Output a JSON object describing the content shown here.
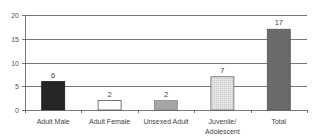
{
  "chart_data": {
    "type": "bar",
    "title": "",
    "xlabel": "",
    "ylabel": "",
    "categories": [
      "Adult Male",
      "Adult Female",
      "Unsexed Adult",
      "Juvenile/ Adolescent",
      "Total"
    ],
    "category_lines": [
      [
        "Adult Male"
      ],
      [
        "Adult Female"
      ],
      [
        "Unsexed Adult"
      ],
      [
        "Juvenile/",
        "Adolescent"
      ],
      [
        "Total"
      ]
    ],
    "values": [
      6,
      2,
      2,
      7,
      17
    ],
    "data_labels": [
      "6",
      "2",
      "2",
      "7",
      "17"
    ],
    "ylim": [
      0,
      20
    ],
    "yticks": [
      0,
      5,
      10,
      15,
      20
    ],
    "ytick_labels": [
      "0",
      "5",
      "10",
      "15",
      "20"
    ],
    "grid": true,
    "legend": null,
    "bar_styles": [
      {
        "fill": "#262626",
        "stroke": "#1a1a1a",
        "pattern": "solid-black"
      },
      {
        "fill": "#ffffff",
        "stroke": "#555555",
        "pattern": "white"
      },
      {
        "fill": "#a6a6a6",
        "stroke": "#8a8a8a",
        "pattern": "solid-gray"
      },
      {
        "fill": "#dcdcdc",
        "stroke": "#666666",
        "pattern": "dotted-light-gray"
      },
      {
        "fill": "#6a6a6a",
        "stroke": "#555555",
        "pattern": "solid-dark-gray"
      }
    ]
  }
}
